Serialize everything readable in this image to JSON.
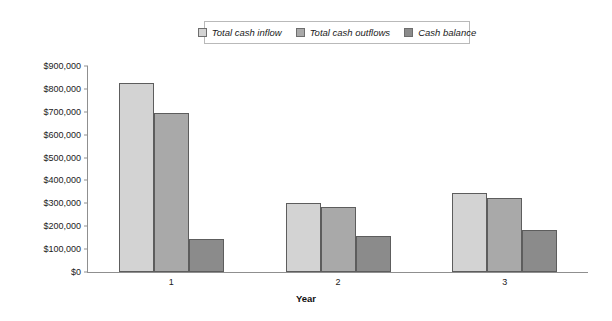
{
  "chart_data": {
    "type": "bar",
    "title": "",
    "xlabel": "Year",
    "ylabel": "",
    "categories": [
      "1",
      "2",
      "3"
    ],
    "series": [
      {
        "name": "Total cash inflow",
        "color": "#d3d3d3",
        "values": [
          825000,
          301000,
          345000
        ]
      },
      {
        "name": "Total cash outflows",
        "color": "#a9a9a9",
        "values": [
          695000,
          284000,
          323000
        ]
      },
      {
        "name": "Cash balance",
        "color": "#8b8b8b",
        "values": [
          144000,
          157000,
          183000
        ]
      }
    ],
    "ylim": [
      0,
      900000
    ],
    "yticks": [
      0,
      100000,
      200000,
      300000,
      400000,
      500000,
      600000,
      700000,
      800000,
      900000
    ],
    "ytick_labels": [
      "$0",
      "$100,000",
      "$200,000",
      "$300,000",
      "$400,000",
      "$500,000",
      "$600,000",
      "$700,000",
      "$800,000",
      "$900,000"
    ],
    "grid": false,
    "legend_position": "top-center"
  },
  "legend": {
    "entries": [
      {
        "label": "Total cash inflow",
        "swatch": "#d3d3d3"
      },
      {
        "label": "Total cash outflows",
        "swatch": "#a9a9a9"
      },
      {
        "label": "Cash balance",
        "swatch": "#8b8b8b"
      }
    ]
  },
  "axes": {
    "x_title": "Year",
    "x_labels": [
      "1",
      "2",
      "3"
    ],
    "y_labels": [
      "$900,000",
      "$800,000",
      "$700,000",
      "$600,000",
      "$500,000",
      "$400,000",
      "$300,000",
      "$200,000",
      "$100,000",
      "$0"
    ]
  }
}
